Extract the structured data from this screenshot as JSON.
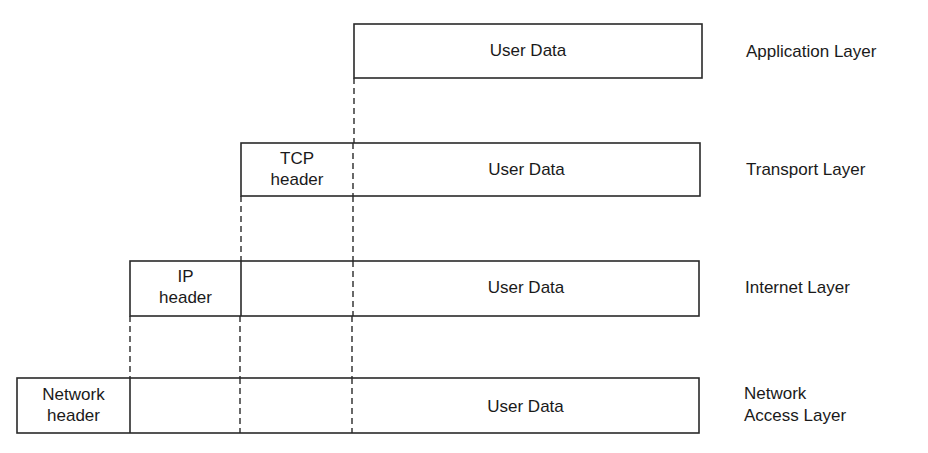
{
  "diagram": {
    "stroke_color": "#2a2a2a",
    "layers": [
      {
        "name": "Application Layer",
        "segments": [
          {
            "label": "User Data"
          }
        ]
      },
      {
        "name": "Transport Layer",
        "segments": [
          {
            "label": "TCP header"
          },
          {
            "label": "User Data"
          }
        ]
      },
      {
        "name": "Internet Layer",
        "segments": [
          {
            "label": "IP header"
          },
          {
            "label": ""
          },
          {
            "label": "User Data"
          }
        ]
      },
      {
        "name": "Network Access Layer",
        "segments": [
          {
            "label": "Network header"
          },
          {
            "label": ""
          },
          {
            "label": ""
          },
          {
            "label": "User Data"
          }
        ]
      }
    ]
  },
  "labels": {
    "app_data": "User Data",
    "app_layer": "Application Layer",
    "tcp_header_line1": "TCP",
    "tcp_header_line2": "header",
    "transport_data": "User Data",
    "transport_layer": "Transport Layer",
    "ip_header_line1": "IP",
    "ip_header_line2": "header",
    "internet_data": "User Data",
    "internet_layer": "Internet Layer",
    "net_header_line1": "Network",
    "net_header_line2": "header",
    "network_data": "User Data",
    "network_layer_line1": "Network",
    "network_layer_line2": "Access Layer"
  }
}
